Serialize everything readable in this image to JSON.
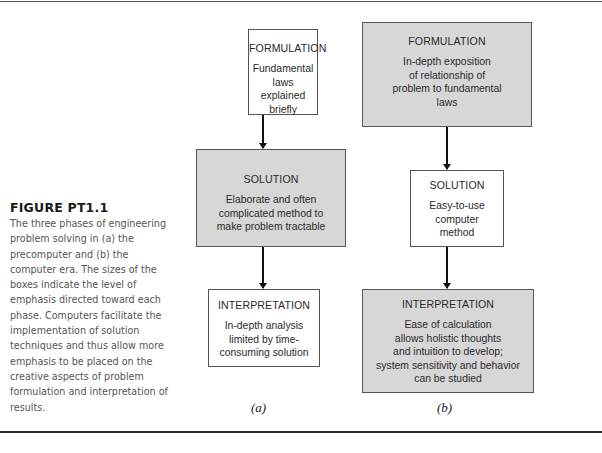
{
  "caption": {
    "title": "FIGURE PT1.1",
    "body": "The three phases of engineering\nproblem solving in (a) the\nprecomputer and (b) the\ncomputer era. The sizes of the\nboxes indicate the level of\nemphasis directed toward each\nphase. Computers facilitate the\nimplementation of solution\ntechniques and thus allow more\nemphasis to be placed on the\ncreative aspects of problem\nformulation and interpretation of\nresults."
  },
  "panels": {
    "a": {
      "label": "(a)",
      "formulation": {
        "title": "FORMULATION",
        "text": "Fundamental\nlaws explained\nbriefly",
        "emphasis": "low",
        "fill": "#ffffff"
      },
      "solution": {
        "title": "SOLUTION",
        "text": "Elaborate and often\ncomplicated method to\nmake problem tractable",
        "emphasis": "high",
        "fill": "#d7d7d7"
      },
      "interpretation": {
        "title": "INTERPRETATION",
        "text": "In-depth analysis\nlimited by time-\nconsuming solution",
        "emphasis": "low",
        "fill": "#ffffff"
      }
    },
    "b": {
      "label": "(b)",
      "formulation": {
        "title": "FORMULATION",
        "text": "In-depth exposition\nof relationship of\nproblem to fundamental\nlaws",
        "emphasis": "high",
        "fill": "#d7d7d7"
      },
      "solution": {
        "title": "SOLUTION",
        "text": "Easy-to-use\ncomputer\nmethod",
        "emphasis": "low",
        "fill": "#ffffff"
      },
      "interpretation": {
        "title": "INTERPRETATION",
        "text": "Ease of calculation\nallows holistic thoughts\nand intuition to develop;\nsystem sensitivity and behavior\ncan be studied",
        "emphasis": "high",
        "fill": "#d7d7d7"
      }
    }
  },
  "colors": {
    "emphasis_fill": "#d7d7d7",
    "plain_fill": "#ffffff",
    "border": "#555555",
    "arrow": "#111111"
  }
}
